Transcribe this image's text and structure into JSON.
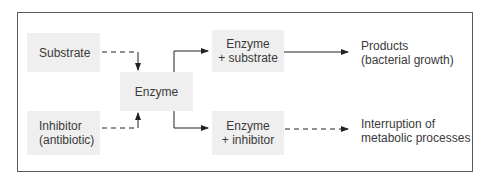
{
  "diagram": {
    "nodes": {
      "substrate": {
        "label": "Substrate"
      },
      "inhibitor": {
        "line1": "Inhibitor",
        "line2": "(antibiotic)"
      },
      "enzyme": {
        "label": "Enzyme"
      },
      "enzyme_substrate": {
        "line1": "Enzyme",
        "line2": "+ substrate"
      },
      "enzyme_inhibitor": {
        "line1": "Enzyme",
        "line2": "+ inhibitor"
      },
      "products": {
        "line1": "Products",
        "line2": "(bacterial growth)"
      },
      "interruption": {
        "line1": "Interruption of",
        "line2": "metabolic processes"
      }
    },
    "edges": [
      {
        "from": "substrate",
        "to": "enzyme",
        "style": "dashed"
      },
      {
        "from": "inhibitor",
        "to": "enzyme",
        "style": "dashed"
      },
      {
        "from": "enzyme",
        "to": "enzyme_substrate",
        "style": "solid"
      },
      {
        "from": "enzyme",
        "to": "enzyme_inhibitor",
        "style": "solid"
      },
      {
        "from": "enzyme_substrate",
        "to": "products",
        "style": "solid"
      },
      {
        "from": "enzyme_inhibitor",
        "to": "interruption",
        "style": "dashed"
      }
    ],
    "colors": {
      "box_fill": "#efefef",
      "line": "#222222",
      "border": "#5a5a5a"
    }
  }
}
